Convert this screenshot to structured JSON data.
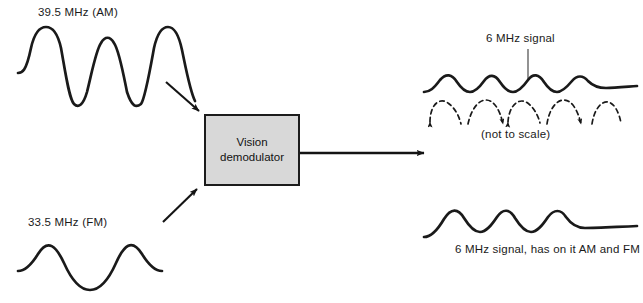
{
  "diagram": {
    "type": "block-diagram",
    "background_color": "#ffffff",
    "line_color": "#1a1a1a",
    "block": {
      "title_line_1": "Vision",
      "title_line_2": "demodulator",
      "fill_color": "#d8d8d8",
      "border_color": "#1c1c1c"
    },
    "inputs": [
      {
        "id": "am-input",
        "label": "39.5 MHz (AM)",
        "waveform": "sine",
        "cycles": 3.5,
        "description": "amplitude-modulated vision carrier"
      },
      {
        "id": "fm-input",
        "label": "33.5 MHz (FM)",
        "waveform": "sine",
        "cycles": 2.5,
        "description": "frequency-modulated sound carrier"
      }
    ],
    "outputs": [
      {
        "id": "output-top",
        "callout": "6 MHz signal",
        "note": "(not to scale)",
        "waveform": "ripple-on-envelope",
        "dashed_overlay": true
      },
      {
        "id": "output-bottom",
        "caption": "6 MHz signal, has on it AM and FM",
        "waveform": "ripple-on-envelope",
        "dashed_overlay": false
      }
    ],
    "arrows": [
      {
        "id": "arrow-am-to-block",
        "direction": "down-right"
      },
      {
        "id": "arrow-fm-to-block",
        "direction": "up-right"
      },
      {
        "id": "arrow-block-output",
        "direction": "right"
      }
    ]
  }
}
